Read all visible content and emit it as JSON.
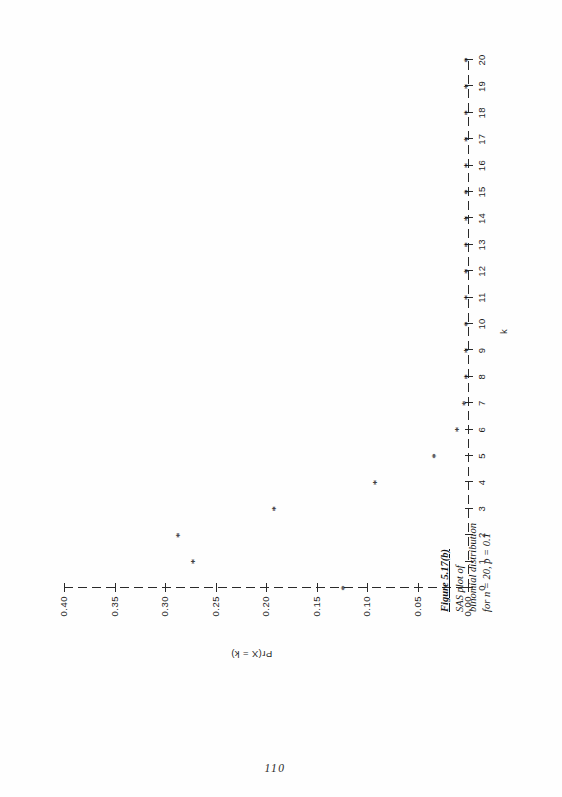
{
  "page": {
    "folio": "110",
    "orientation": "landscape-figure-on-portrait-page"
  },
  "caption": {
    "figure_number": "Figure 5.17(b)",
    "line1": "SAS plot of",
    "line2": "binomial distribution",
    "line3": "for n = 20, p = 0.1"
  },
  "chart_data": {
    "type": "scatter",
    "title": "",
    "subtitle": "",
    "xlabel": "k",
    "ylabel": "Pr(X = k)",
    "marker": "*",
    "grid": false,
    "legend": null,
    "xlim": [
      0,
      20
    ],
    "ylim": [
      0.0,
      0.4
    ],
    "x_ticks": [
      0,
      1,
      2,
      3,
      4,
      5,
      6,
      7,
      8,
      9,
      10,
      11,
      12,
      13,
      14,
      15,
      16,
      17,
      18,
      19,
      20
    ],
    "x_tick_labels": [
      "0",
      "1",
      "2",
      "3",
      "4",
      "5",
      "6",
      "7",
      "8",
      "9",
      "10",
      "11",
      "12",
      "13",
      "14",
      "15",
      "16",
      "17",
      "18",
      "19",
      "20"
    ],
    "y_ticks": [
      0.0,
      0.05,
      0.1,
      0.15,
      0.2,
      0.25,
      0.3,
      0.35,
      0.4
    ],
    "y_tick_labels": [
      "0.00",
      "0.05",
      "0.10",
      "0.15",
      "0.20",
      "0.25",
      "0.30",
      "0.35",
      "0.40"
    ],
    "x": [
      0,
      1,
      2,
      3,
      4,
      5,
      6,
      7,
      8,
      9,
      10,
      11,
      12,
      13,
      14,
      15,
      16,
      17,
      18,
      19,
      20
    ],
    "values": [
      0.1216,
      0.2702,
      0.2852,
      0.1901,
      0.0898,
      0.0319,
      0.0089,
      0.002,
      0.0004,
      0.0001,
      0.0,
      0.0,
      0.0,
      0.0,
      0.0,
      0.0,
      0.0,
      0.0,
      0.0,
      0.0,
      0.0
    ],
    "distribution": "binomial",
    "n": 20,
    "p": 0.1
  }
}
